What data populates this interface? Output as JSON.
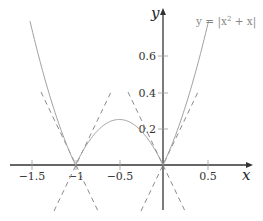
{
  "chart_data": {
    "type": "line",
    "title": "",
    "xlabel": "x",
    "ylabel": "y",
    "xlim": [
      -1.75,
      0.75
    ],
    "ylim": [
      -0.3,
      0.8
    ],
    "grid": false,
    "x_ticks": [
      -1.5,
      -1,
      -0.5,
      0.5
    ],
    "x_tick_labels": [
      "−1.5",
      "−1",
      "−0.5",
      "0.5"
    ],
    "y_ticks": [
      0.2,
      0.4,
      0.6
    ],
    "y_tick_labels": [
      "0.2",
      "0.4",
      "0.6"
    ],
    "series": [
      {
        "name": "y = |x² + x|",
        "style": "solid",
        "color": "#9a9a9a",
        "function": "abs(x^2 + x)",
        "x_range": [
          -1.52,
          0.52
        ]
      },
      {
        "name": "tangent y = -(x+1) (left of -1)",
        "style": "dashed",
        "color": "#8a8a8a",
        "points": [
          [
            -1.4,
            0.4
          ],
          [
            -0.75,
            -0.25
          ]
        ]
      },
      {
        "name": "tangent y = x+1 (at -1)",
        "style": "dashed",
        "color": "#8a8a8a",
        "points": [
          [
            -1.25,
            -0.25
          ],
          [
            -0.6,
            0.4
          ]
        ]
      },
      {
        "name": "tangent y = -x (at 0)",
        "style": "dashed",
        "color": "#8a8a8a",
        "points": [
          [
            -0.4,
            0.4
          ],
          [
            0.25,
            -0.25
          ]
        ]
      },
      {
        "name": "tangent y = x (at 0)",
        "style": "dashed",
        "color": "#8a8a8a",
        "points": [
          [
            -0.25,
            -0.25
          ],
          [
            0.4,
            0.4
          ]
        ]
      }
    ],
    "legend": {
      "entries": [
        "y = |x² + x|"
      ],
      "position": "top-right"
    },
    "annotations": []
  },
  "labels": {
    "x_axis": "x",
    "y_axis": "y",
    "legend_prefix": "y = |x",
    "legend_sup": "2",
    "legend_suffix": " + x|",
    "xt0": "−1.5",
    "xt1": "−1",
    "xt2": "−0.5",
    "xt3": "0.5",
    "yt0": "0.2",
    "yt1": "0.4",
    "yt2": "0.6"
  }
}
